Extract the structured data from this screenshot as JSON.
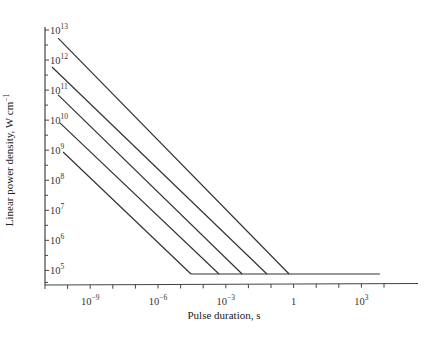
{
  "chart_data": {
    "type": "line",
    "title": "",
    "xlabel": "Pulse duration, s",
    "ylabel": "Linear power density, W cm⁻¹",
    "xscale": "log",
    "yscale": "log",
    "xlim_log10": [
      -11,
      4.8
    ],
    "ylim_log10": [
      4.5,
      13.1
    ],
    "grid": false,
    "legend": null,
    "x_ticks": [
      {
        "log10": -9,
        "base": "10",
        "exp": "−9"
      },
      {
        "log10": -6,
        "base": "10",
        "exp": "−6"
      },
      {
        "log10": -3,
        "base": "10",
        "exp": "−3"
      },
      {
        "log10": 0,
        "base": "1",
        "exp": ""
      },
      {
        "log10": 3,
        "base": "10",
        "exp": "3"
      }
    ],
    "x_minor_ticks_log10": [
      -11,
      -10,
      -9,
      -8,
      -7,
      -6,
      -5,
      -4,
      -3,
      -2,
      -1,
      0,
      1,
      2,
      3,
      4
    ],
    "y_ticks": [
      {
        "log10": 13,
        "base": "10",
        "exp": "13"
      },
      {
        "log10": 12,
        "base": "10",
        "exp": "12"
      },
      {
        "log10": 11,
        "base": "10",
        "exp": "11"
      },
      {
        "log10": 10,
        "base": "10",
        "exp": "10"
      },
      {
        "log10": 9,
        "base": "10",
        "exp": "9"
      },
      {
        "log10": 8,
        "base": "10",
        "exp": "8"
      },
      {
        "log10": 7,
        "base": "10",
        "exp": "7"
      },
      {
        "log10": 6,
        "base": "10",
        "exp": "6"
      },
      {
        "log10": 5,
        "base": "10",
        "exp": "5"
      }
    ],
    "y_minor_ticks_log10": [
      12.5,
      11.5,
      10.5,
      9.5,
      8.5,
      7.5,
      6.5,
      5.5,
      4.6
    ],
    "series": [
      {
        "name": "line-1",
        "points_log10": [
          [
            -10.42,
            12.73
          ],
          [
            -0.2,
            4.88
          ]
        ]
      },
      {
        "name": "line-2",
        "points_log10": [
          [
            -10.69,
            11.77
          ],
          [
            -1.18,
            4.88
          ]
        ]
      },
      {
        "name": "line-3",
        "points_log10": [
          [
            -10.42,
            10.84
          ],
          [
            -2.28,
            4.88
          ]
        ]
      },
      {
        "name": "line-4",
        "points_log10": [
          [
            -10.34,
            9.91
          ],
          [
            -3.3,
            4.88
          ]
        ]
      },
      {
        "name": "line-5",
        "points_log10": [
          [
            -10.2,
            8.94
          ],
          [
            -4.54,
            4.88
          ]
        ]
      },
      {
        "name": "threshold",
        "points_log10": [
          [
            -4.54,
            4.88
          ],
          [
            3.82,
            4.88
          ]
        ]
      }
    ],
    "line_color": "#333333"
  },
  "axes": {
    "x_label": "Pulse duration, s",
    "y_label": "Linear power density, W cm",
    "y_label_exp": "−1"
  }
}
